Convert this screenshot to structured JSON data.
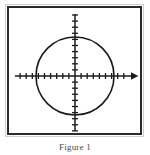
{
  "figure": {
    "caption": "Figure 1",
    "frame": {
      "border_color": "#2b2b2b",
      "outer_border_color": "#cfcfcf",
      "background": "#ffffff"
    }
  },
  "chart_data": {
    "type": "scatter",
    "title": "",
    "subtitle": "",
    "xlabel": "",
    "ylabel": "",
    "grid": false,
    "legend": null,
    "axes": {
      "origin_px": [
        75,
        76
      ],
      "x_axis": {
        "label": "",
        "arrow_end": "right",
        "start_px": 15,
        "end_px": 136,
        "tick_count": 20,
        "tick_spacing_px": 6.1,
        "tick_half_length_px": 3,
        "tick_labels": []
      },
      "y_axis": {
        "label": "",
        "arrow_end": "none",
        "start_px": 14,
        "end_px": 131,
        "tick_count": 19,
        "tick_spacing_px": 6.1,
        "tick_half_length_px": 3,
        "tick_labels": []
      }
    },
    "shapes": [
      {
        "kind": "circle",
        "name": "circle-centered-at-origin",
        "center_px": [
          75,
          76
        ],
        "center_units": [
          0,
          0
        ],
        "radius_px": 39,
        "radius_units": 6.4,
        "stroke": "#1a1a1a",
        "stroke_width_px": 1.6,
        "fill": "none"
      }
    ],
    "series": [],
    "annotations": []
  },
  "colors": {
    "ink": "#1a1a1a",
    "frame": "#2b2b2b",
    "paper": "#ffffff",
    "caption": "#4a4a4a"
  }
}
